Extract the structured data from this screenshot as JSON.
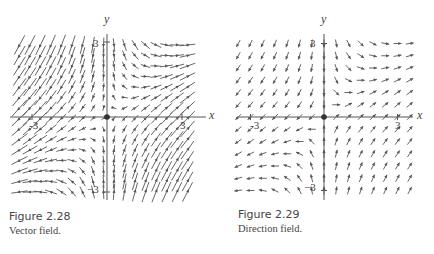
{
  "figures": [
    {
      "id": "left",
      "number": "Figure 2.28",
      "caption": "Vector field.",
      "kind": "vector",
      "axis_labels": {
        "x": "x",
        "y": "y"
      },
      "ticks": {
        "x_neg": "-3",
        "x_pos": "3",
        "y_pos": "3",
        "y_neg": "−3"
      }
    },
    {
      "id": "right",
      "number": "Figure 2.29",
      "caption": "Direction field.",
      "kind": "direction",
      "axis_labels": {
        "x": "x",
        "y": "y"
      },
      "ticks": {
        "x_neg": "-3",
        "x_pos": "3",
        "y_pos": "3",
        "y_neg": "−3"
      }
    }
  ],
  "chart_data": [
    {
      "type": "vector_field",
      "title": "Figure 2.28 Vector field.",
      "field": {
        "F_x": "x",
        "F_y": "x - y"
      },
      "xlabel": "x",
      "ylabel": "y",
      "xlim": [
        -3.8,
        3.8
      ],
      "ylim": [
        -3.3,
        3.3
      ],
      "x_ticks": [
        -3,
        3
      ],
      "y_ticks": [
        -3,
        3
      ],
      "arrow_length": "proportional to magnitude",
      "equilibrium_point": [
        0,
        0
      ]
    },
    {
      "type": "direction_field",
      "title": "Figure 2.29 Direction field.",
      "field": {
        "F_x": "x",
        "F_y": "x - y"
      },
      "xlabel": "x",
      "ylabel": "y",
      "xlim": [
        -3.8,
        3.8
      ],
      "ylim": [
        -3.3,
        3.3
      ],
      "x_ticks": [
        -3,
        3
      ],
      "y_ticks": [
        -3,
        3
      ],
      "arrow_length": "uniform (normalized)",
      "equilibrium_point": [
        0,
        0
      ]
    }
  ],
  "colors": {
    "ink": "#555555",
    "background": "#ffffff"
  }
}
